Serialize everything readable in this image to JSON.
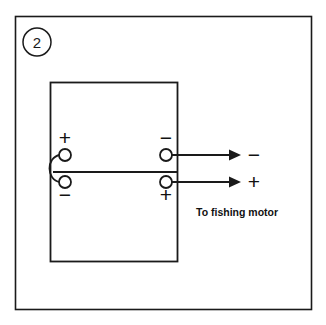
{
  "figure": {
    "step_number": "2",
    "destination_label": "To fishing motor",
    "background_color": "#ffffff",
    "line_color": "#1a1a1a"
  },
  "battery": {
    "left_terminals": {
      "top_sign": "+",
      "bottom_sign": "−"
    },
    "right_terminals": {
      "top_sign": "−",
      "bottom_sign": "+"
    }
  },
  "output_leads": [
    {
      "sign": "−"
    },
    {
      "sign": "+"
    }
  ]
}
